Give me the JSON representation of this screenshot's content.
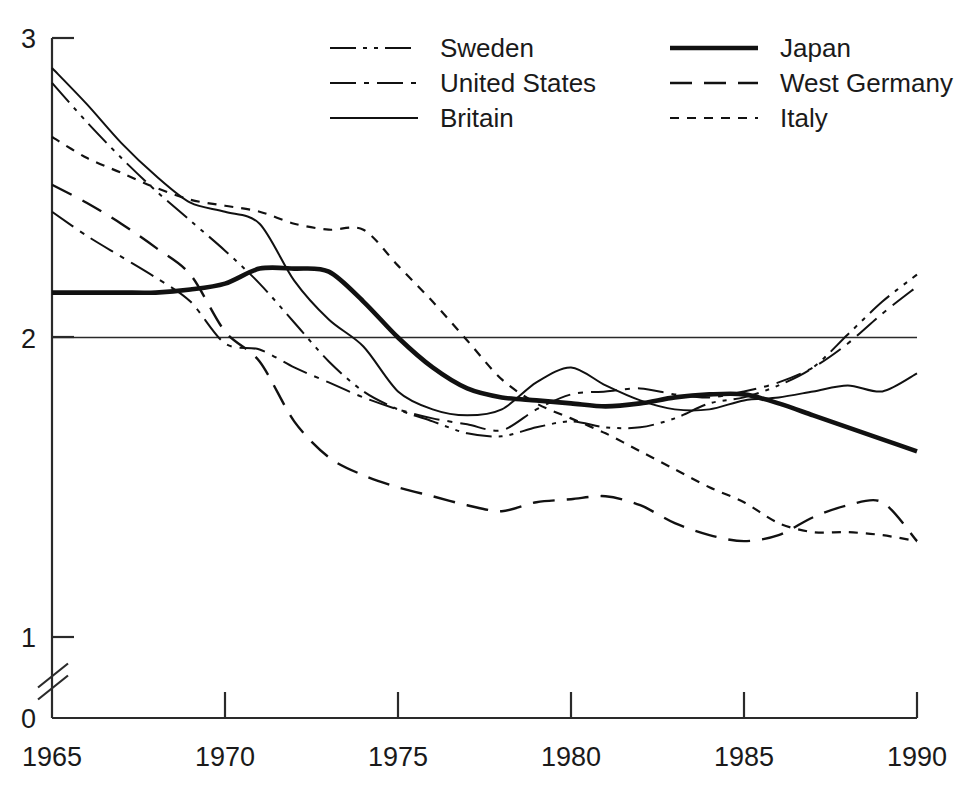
{
  "chart_data": {
    "type": "line",
    "title": "",
    "xlabel": "",
    "ylabel": "",
    "xlim": [
      1965,
      1990
    ],
    "ylim": [
      0,
      3
    ],
    "yaxis_break": true,
    "yaxis_break_between": [
      0,
      1
    ],
    "grid": false,
    "reference_line_y": 2,
    "legend_position": "top-center",
    "xticks": [
      1965,
      1970,
      1975,
      1980,
      1985,
      1990
    ],
    "xtick_labels": [
      "1965",
      "1970",
      "1975",
      "1980",
      "1985",
      "1990"
    ],
    "yticks": [
      0,
      1,
      2,
      3
    ],
    "ytick_labels": [
      "0",
      "1",
      "2",
      "3"
    ],
    "x": [
      1965,
      1966,
      1967,
      1968,
      1969,
      1970,
      1971,
      1972,
      1973,
      1974,
      1975,
      1976,
      1977,
      1978,
      1979,
      1980,
      1981,
      1982,
      1983,
      1984,
      1985,
      1986,
      1987,
      1988,
      1989,
      1990
    ],
    "series": [
      {
        "name": "Sweden",
        "dash": "dash-dot-dot",
        "width": 2.0,
        "values": [
          2.85,
          2.72,
          2.6,
          2.49,
          2.39,
          2.29,
          2.18,
          2.05,
          1.92,
          1.82,
          1.76,
          1.72,
          1.68,
          1.67,
          1.7,
          1.72,
          1.7,
          1.7,
          1.73,
          1.78,
          1.8,
          1.84,
          1.9,
          2.01,
          2.12,
          2.21
        ]
      },
      {
        "name": "United States",
        "dash": "dash-dot",
        "width": 2.0,
        "values": [
          2.42,
          2.34,
          2.27,
          2.2,
          2.12,
          1.98,
          1.96,
          1.9,
          1.85,
          1.8,
          1.76,
          1.73,
          1.71,
          1.69,
          1.76,
          1.81,
          1.82,
          1.83,
          1.81,
          1.8,
          1.82,
          1.85,
          1.9,
          1.98,
          2.08,
          2.17
        ]
      },
      {
        "name": "Britain",
        "dash": "solid",
        "width": 2.0,
        "values": [
          2.9,
          2.78,
          2.65,
          2.54,
          2.45,
          2.42,
          2.38,
          2.19,
          2.06,
          1.97,
          1.82,
          1.76,
          1.74,
          1.76,
          1.85,
          1.9,
          1.84,
          1.79,
          1.76,
          1.76,
          1.79,
          1.8,
          1.82,
          1.84,
          1.82,
          1.88
        ]
      },
      {
        "name": "Japan",
        "dash": "solid",
        "width": 4.6,
        "values": [
          2.15,
          2.15,
          2.15,
          2.15,
          2.16,
          2.18,
          2.23,
          2.23,
          2.22,
          2.12,
          2.0,
          1.9,
          1.83,
          1.8,
          1.79,
          1.78,
          1.77,
          1.78,
          1.8,
          1.81,
          1.81,
          1.78,
          1.74,
          1.7,
          1.66,
          1.62
        ]
      },
      {
        "name": "West Germany",
        "dash": "long-dash",
        "width": 2.4,
        "values": [
          2.51,
          2.45,
          2.38,
          2.3,
          2.21,
          2.02,
          1.92,
          1.72,
          1.6,
          1.54,
          1.5,
          1.47,
          1.44,
          1.42,
          1.45,
          1.46,
          1.47,
          1.44,
          1.38,
          1.34,
          1.32,
          1.34,
          1.4,
          1.44,
          1.45,
          1.32
        ]
      },
      {
        "name": "Italy",
        "dash": "short-dash",
        "width": 2.2,
        "values": [
          2.67,
          2.6,
          2.55,
          2.5,
          2.46,
          2.44,
          2.42,
          2.38,
          2.36,
          2.36,
          2.24,
          2.12,
          1.99,
          1.86,
          1.78,
          1.73,
          1.68,
          1.62,
          1.56,
          1.5,
          1.45,
          1.38,
          1.35,
          1.35,
          1.34,
          1.32
        ]
      }
    ]
  },
  "legend": {
    "entries": [
      {
        "label": "Sweden",
        "dash": "dash-dot-dot",
        "width": 2.0,
        "col": 0,
        "row": 0
      },
      {
        "label": "United States",
        "dash": "dash-dot",
        "width": 2.0,
        "col": 0,
        "row": 1
      },
      {
        "label": "Britain",
        "dash": "solid",
        "width": 2.0,
        "col": 0,
        "row": 2
      },
      {
        "label": "Japan",
        "dash": "solid",
        "width": 4.6,
        "col": 1,
        "row": 0
      },
      {
        "label": "West Germany",
        "dash": "long-dash",
        "width": 2.4,
        "col": 1,
        "row": 1
      },
      {
        "label": "Italy",
        "dash": "short-dash",
        "width": 2.2,
        "col": 1,
        "row": 2
      }
    ]
  },
  "colors": {
    "line": "#111111",
    "axis": "#2a2a2a",
    "background": "#ffffff"
  }
}
